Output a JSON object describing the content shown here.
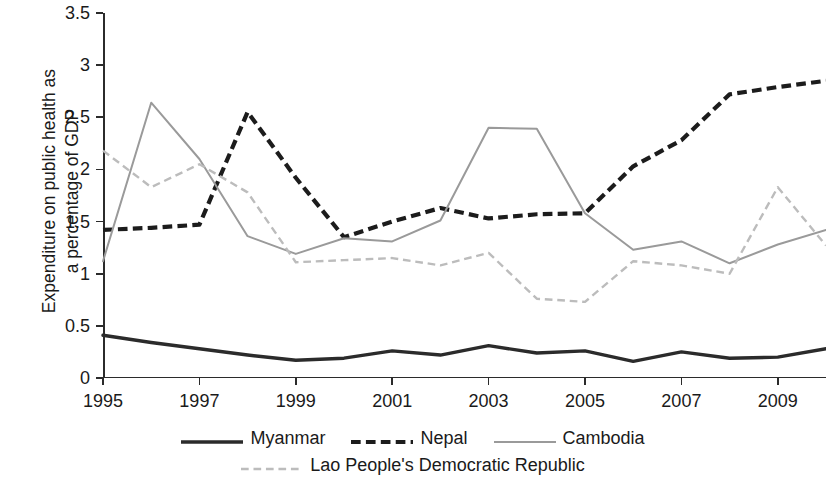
{
  "chart_data": {
    "type": "line",
    "title": "",
    "xlabel": "",
    "ylabel": "Expenditure on public health as\na percentage of GDP",
    "xlim": [
      1995,
      2010
    ],
    "ylim": [
      0,
      3.5
    ],
    "yticks": [
      0,
      0.5,
      1,
      1.5,
      2,
      2.5,
      3,
      3.5
    ],
    "ytick_labels": [
      "0",
      "0.5",
      "1",
      "1.5",
      "2",
      "2.5",
      "3",
      "3.5"
    ],
    "xticks": [
      1995,
      1997,
      1999,
      2001,
      2003,
      2005,
      2007,
      2009
    ],
    "xtick_labels": [
      "1995",
      "1997",
      "1999",
      "2001",
      "2003",
      "2005",
      "2007",
      "2009"
    ],
    "x": [
      1995,
      1996,
      1997,
      1998,
      1999,
      2000,
      2001,
      2002,
      2003,
      2004,
      2005,
      2006,
      2007,
      2008,
      2009,
      2010
    ],
    "grid": false,
    "legend_position": "bottom",
    "series": [
      {
        "name": "Myanmar",
        "style": "solid",
        "color": "#2b2b2b",
        "width": 3.4,
        "values": [
          0.41,
          0.34,
          0.28,
          0.22,
          0.17,
          0.19,
          0.26,
          0.22,
          0.31,
          0.24,
          0.26,
          0.16,
          0.25,
          0.19,
          0.2,
          0.28
        ]
      },
      {
        "name": "Nepal",
        "style": "dashed",
        "color": "#1c1c1c",
        "width": 4.2,
        "values": [
          1.42,
          1.44,
          1.47,
          2.55,
          1.92,
          1.35,
          1.5,
          1.63,
          1.53,
          1.57,
          1.58,
          2.03,
          2.28,
          2.72,
          2.79,
          2.85
        ]
      },
      {
        "name": "Cambodia",
        "style": "solid",
        "color": "#9a9a9a",
        "width": 2.0,
        "values": [
          1.12,
          2.64,
          2.1,
          1.36,
          1.19,
          1.34,
          1.31,
          1.51,
          2.4,
          2.39,
          1.58,
          1.23,
          1.31,
          1.1,
          1.28,
          1.42
        ]
      },
      {
        "name": "Lao People's Democratic Republic",
        "style": "dashed",
        "color": "#bcbcbc",
        "width": 2.4,
        "values": [
          2.18,
          1.83,
          2.05,
          1.78,
          1.11,
          1.13,
          1.15,
          1.08,
          1.2,
          0.76,
          0.73,
          1.12,
          1.08,
          1.0,
          1.83,
          1.27
        ]
      }
    ]
  },
  "legend": {
    "rows": [
      [
        {
          "label": "Myanmar",
          "series": 0
        },
        {
          "label": "Nepal",
          "series": 1
        },
        {
          "label": "Cambodia",
          "series": 2
        }
      ],
      [
        {
          "label": "Lao People's Democratic Republic",
          "series": 3
        }
      ]
    ]
  }
}
